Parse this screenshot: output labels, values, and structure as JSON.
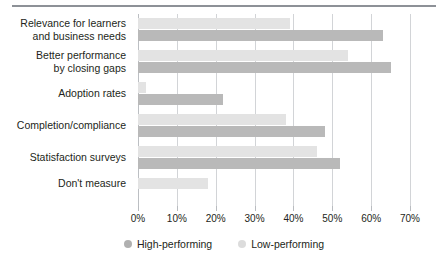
{
  "chart_data": {
    "type": "bar",
    "orientation": "horizontal",
    "title": "",
    "subtitle": "",
    "xlabel": "",
    "ylabel": "",
    "xlim": [
      0,
      70
    ],
    "xtick_labels": [
      "0%",
      "10%",
      "20%",
      "30%",
      "40%",
      "50%",
      "60%",
      "70%"
    ],
    "xticks": [
      0,
      10,
      20,
      30,
      40,
      50,
      60,
      70
    ],
    "grid": true,
    "legend_position": "bottom-center",
    "categories": [
      "Relevance for learners\nand business needs",
      "Better performance\nby closing gaps",
      "Adoption rates",
      "Completion/compliance",
      "Statisfaction surveys",
      "Don't measure"
    ],
    "series": [
      {
        "name": "High-performing",
        "color": "#b9b9b9",
        "values": [
          63,
          65,
          22,
          48,
          52,
          0
        ]
      },
      {
        "name": "Low-performing",
        "color": "#e3e3e3",
        "values": [
          39,
          54,
          2,
          38,
          46,
          18
        ]
      }
    ]
  },
  "legend": {
    "items": [
      {
        "label": "High-performing",
        "swatch": "high"
      },
      {
        "label": "Low-performing",
        "swatch": "low"
      }
    ]
  }
}
